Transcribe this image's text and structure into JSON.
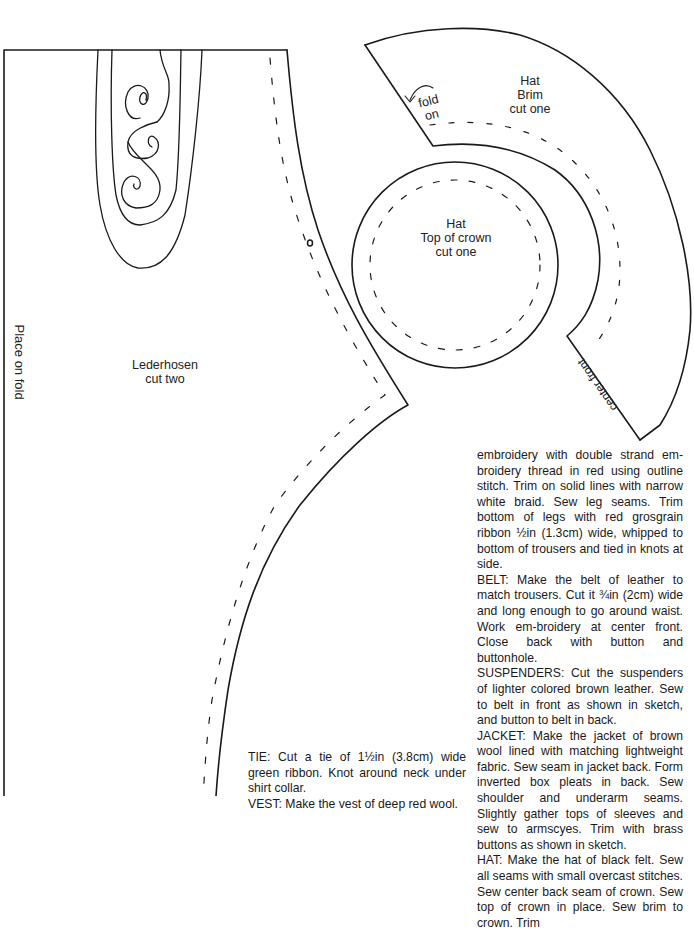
{
  "pattern_pieces": {
    "lederhosen": {
      "title": "Lederhosen",
      "cut": "cut two",
      "fold_label": "Place on fold"
    },
    "hat_brim": {
      "title": "Hat",
      "subtitle": "Brim",
      "cut": "cut one",
      "fold_label_line1": "fold",
      "fold_label_line2": "on",
      "center_label": "center front"
    },
    "hat_crown_top": {
      "title": "Hat",
      "subtitle": "Top of crown",
      "cut": "cut one"
    }
  },
  "instructions_right": [
    "embroidery with double strand em-broidery thread in red using outline stitch. Trim on solid lines with narrow white braid. Sew leg seams. Trim bottom of legs with red grosgrain ribbon ½in (1.3cm) wide, whipped to bottom of trousers and tied in knots at side.",
    "BELT: Make the belt of leather to match trousers. Cut it ¾in (2cm) wide and long enough to go around waist. Work em-broidery at center front. Close back with button and buttonhole.",
    "SUSPENDERS: Cut the suspenders of lighter colored brown leather. Sew to belt in front as shown in sketch, and button to belt in back.",
    "JACKET: Make the jacket of brown wool lined with matching lightweight fabric. Sew seam in jacket back. Form inverted box pleats in back. Sew shoulder and underarm seams. Slightly gather tops of sleeves and sew to armscyes. Trim with brass buttons as shown in sketch.",
    "HAT: Make the hat of black felt. Sew all seams with small overcast stitches. Sew center back seam of crown. Sew top of crown in place. Sew brim to crown. Trim"
  ],
  "instructions_left": [
    "TIE: Cut a tie of 1½in (3.8cm) wide green ribbon. Knot around neck under shirt collar.",
    "VEST: Make the vest of deep red wool."
  ]
}
